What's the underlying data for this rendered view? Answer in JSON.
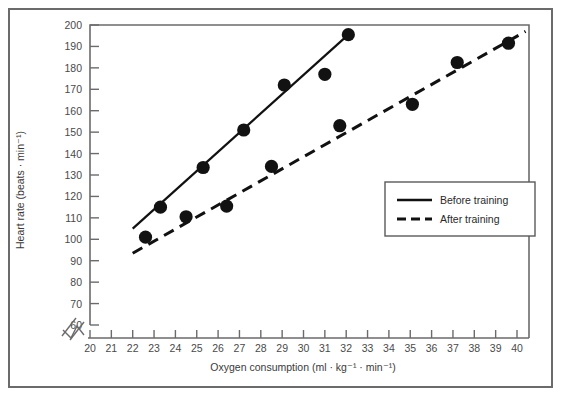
{
  "chart_data": {
    "type": "scatter",
    "title": "",
    "xlabel": "Oxygen consumption (ml · kg⁻¹ · min⁻¹)",
    "ylabel": "Heart rate (beats · min⁻¹)",
    "xlim": [
      20,
      40
    ],
    "ylim": [
      60,
      200
    ],
    "xticks": [
      20,
      21,
      22,
      23,
      24,
      25,
      26,
      27,
      28,
      29,
      30,
      31,
      32,
      33,
      34,
      35,
      36,
      37,
      38,
      39,
      40
    ],
    "yticks": [
      60,
      70,
      80,
      90,
      100,
      110,
      120,
      130,
      140,
      150,
      160,
      170,
      180,
      190,
      200
    ],
    "xtick_labels": [
      "20",
      "21",
      "22",
      "23",
      "24",
      "25",
      "26",
      "27",
      "28",
      "29",
      "30",
      "31",
      "32",
      "33",
      "34",
      "35",
      "36",
      "37",
      "38",
      "39",
      "40"
    ],
    "ytick_labels": [
      "60",
      "70",
      "80",
      "90",
      "100",
      "110",
      "120",
      "130",
      "140",
      "150",
      "160",
      "170",
      "180",
      "190",
      "200"
    ],
    "grid": false,
    "axis_break": true,
    "axis_break_axis": "x",
    "legend_position": "right-middle",
    "series": [
      {
        "name": "Before training",
        "line_style": "solid",
        "color": "#111111",
        "marker": "circle",
        "points": [
          {
            "x": 23.3,
            "y": 115
          },
          {
            "x": 25.3,
            "y": 133.5
          },
          {
            "x": 27.2,
            "y": 151
          },
          {
            "x": 29.1,
            "y": 172
          },
          {
            "x": 31.0,
            "y": 177
          },
          {
            "x": 32.1,
            "y": 195.5
          }
        ],
        "fit_line": {
          "x_start": 22.0,
          "y_start": 105,
          "x_end": 32.1,
          "y_end": 195.5
        }
      },
      {
        "name": "After training",
        "line_style": "dashed",
        "color": "#111111",
        "marker": "circle",
        "points": [
          {
            "x": 22.6,
            "y": 101
          },
          {
            "x": 24.5,
            "y": 110.5
          },
          {
            "x": 26.4,
            "y": 115.5
          },
          {
            "x": 28.5,
            "y": 134
          },
          {
            "x": 31.7,
            "y": 153
          },
          {
            "x": 35.1,
            "y": 163
          },
          {
            "x": 37.2,
            "y": 182.5
          },
          {
            "x": 39.6,
            "y": 191.5
          }
        ],
        "fit_line": {
          "x_start": 22.0,
          "y_start": 93.5,
          "x_end": 40.4,
          "y_end": 197
        }
      }
    ]
  },
  "legend": {
    "entries": [
      {
        "label": "Before training",
        "style": "solid"
      },
      {
        "label": "After training",
        "style": "dashed"
      }
    ]
  }
}
